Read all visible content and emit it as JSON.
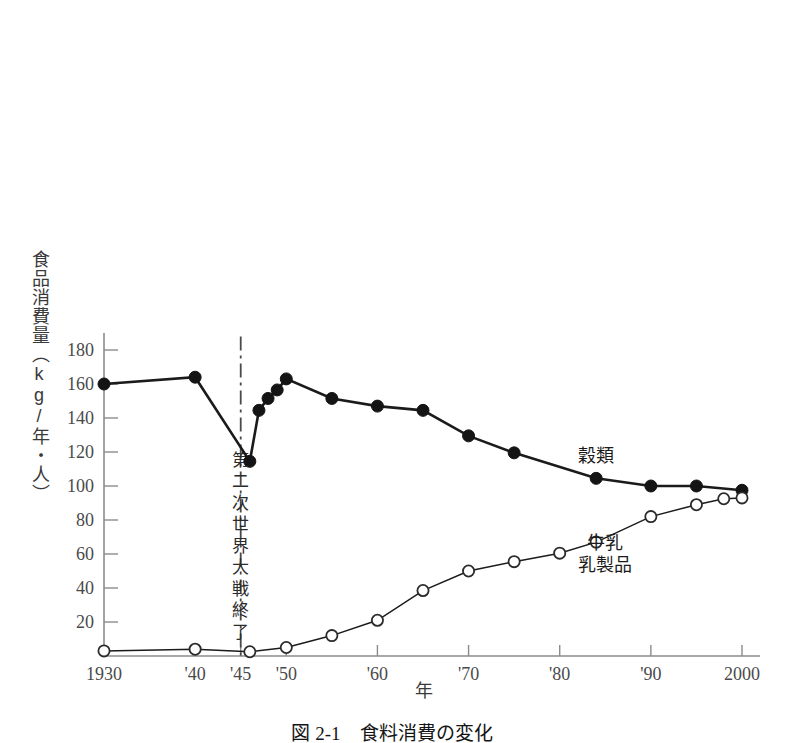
{
  "chart_data": {
    "type": "line",
    "title": "",
    "caption": "図 2-1　食料消費の変化",
    "xlabel": "年",
    "ylabel": "食品消費量（kg/年・人）",
    "xlim": [
      1930,
      2000
    ],
    "ylim": [
      0,
      190
    ],
    "grid": false,
    "legend_position": "inline-right",
    "x_ticks": [
      {
        "value": 1930,
        "label": "1930"
      },
      {
        "value": 1940,
        "label": "'40"
      },
      {
        "value": 1945,
        "label": "'45"
      },
      {
        "value": 1950,
        "label": "'50"
      },
      {
        "value": 1960,
        "label": "'60"
      },
      {
        "value": 1970,
        "label": "'70"
      },
      {
        "value": 1980,
        "label": "'80"
      },
      {
        "value": 1990,
        "label": "'90"
      },
      {
        "value": 2000,
        "label": "2000"
      }
    ],
    "y_ticks": [
      {
        "value": 20,
        "label": "20"
      },
      {
        "value": 40,
        "label": "40"
      },
      {
        "value": 60,
        "label": "60"
      },
      {
        "value": 80,
        "label": "80"
      },
      {
        "value": 100,
        "label": "100"
      },
      {
        "value": 120,
        "label": "120"
      },
      {
        "value": 140,
        "label": "140"
      },
      {
        "value": 160,
        "label": "160"
      },
      {
        "value": 180,
        "label": "180"
      }
    ],
    "series": [
      {
        "name": "穀類",
        "label": "穀類",
        "marker": "filled-circle",
        "color": "#141414",
        "label_x": 1984,
        "label_y": 114,
        "points": [
          {
            "x": 1930,
            "y": 160.0
          },
          {
            "x": 1940,
            "y": 164.0
          },
          {
            "x": 1946,
            "y": 114.5
          },
          {
            "x": 1947,
            "y": 144.5
          },
          {
            "x": 1948,
            "y": 151.5
          },
          {
            "x": 1949,
            "y": 156.5
          },
          {
            "x": 1950,
            "y": 163.0
          },
          {
            "x": 1955,
            "y": 151.5
          },
          {
            "x": 1960,
            "y": 147.0
          },
          {
            "x": 1965,
            "y": 144.5
          },
          {
            "x": 1970,
            "y": 129.5
          },
          {
            "x": 1975,
            "y": 119.5
          },
          {
            "x": 1984,
            "y": 104.5
          },
          {
            "x": 1990,
            "y": 100.0
          },
          {
            "x": 1995,
            "y": 100.0
          },
          {
            "x": 2000,
            "y": 97.5
          }
        ]
      },
      {
        "name": "牛乳・乳製品",
        "label": "牛乳\n乳製品",
        "label_line1": "牛乳",
        "label_line2": "乳製品",
        "marker": "open-circle",
        "color": "#2b2b2b",
        "label_x": 1985,
        "label_y": 63,
        "points": [
          {
            "x": 1930,
            "y": 3.0
          },
          {
            "x": 1940,
            "y": 4.0
          },
          {
            "x": 1946,
            "y": 2.5
          },
          {
            "x": 1950,
            "y": 5.0
          },
          {
            "x": 1955,
            "y": 12.0
          },
          {
            "x": 1960,
            "y": 21.0
          },
          {
            "x": 1965,
            "y": 38.5
          },
          {
            "x": 1970,
            "y": 50.0
          },
          {
            "x": 1975,
            "y": 55.5
          },
          {
            "x": 1980,
            "y": 60.5
          },
          {
            "x": 1984,
            "y": 67.0
          },
          {
            "x": 1990,
            "y": 82.0
          },
          {
            "x": 1995,
            "y": 89.0
          },
          {
            "x": 1998,
            "y": 92.5
          },
          {
            "x": 2000,
            "y": 93.0
          }
        ]
      }
    ],
    "annotations": [
      {
        "name": "end-of-wwii",
        "text": "第二次世界大戦終了",
        "x": 1945,
        "line_y_top": 188,
        "line_y_bottom": 0,
        "label_y_top": 112
      }
    ]
  }
}
